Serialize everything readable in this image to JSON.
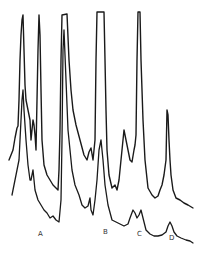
{
  "chart_data": {
    "type": "line",
    "title": "",
    "xlabel": "",
    "ylabel": "",
    "grid": false,
    "legend": null,
    "annotations": [
      {
        "text": "A",
        "x": 40,
        "y": 236
      },
      {
        "text": "B",
        "x": 105,
        "y": 234
      },
      {
        "text": "C",
        "x": 139,
        "y": 236
      },
      {
        "text": "D",
        "x": 171,
        "y": 240
      }
    ],
    "series": [
      {
        "name": "upper-trace",
        "points": [
          [
            9,
            160
          ],
          [
            11,
            155
          ],
          [
            13,
            150
          ],
          [
            15,
            138
          ],
          [
            17,
            128
          ],
          [
            18,
            126
          ],
          [
            19,
            100
          ],
          [
            20,
            60
          ],
          [
            21,
            35
          ],
          [
            22,
            20
          ],
          [
            23,
            15
          ],
          [
            24,
            50
          ],
          [
            25,
            85
          ],
          [
            26,
            100
          ],
          [
            28,
            110
          ],
          [
            30,
            120
          ],
          [
            31,
            140
          ],
          [
            32,
            130
          ],
          [
            33,
            120
          ],
          [
            34,
            125
          ],
          [
            35,
            135
          ],
          [
            36,
            150
          ],
          [
            37,
            100
          ],
          [
            38,
            50
          ],
          [
            39,
            15
          ],
          [
            40,
            35
          ],
          [
            41,
            90
          ],
          [
            42,
            140
          ],
          [
            44,
            165
          ],
          [
            47,
            175
          ],
          [
            50,
            180
          ],
          [
            53,
            185
          ],
          [
            56,
            188
          ],
          [
            58,
            190
          ],
          [
            59,
            170
          ],
          [
            60,
            130
          ],
          [
            61,
            60
          ],
          [
            62,
            15
          ],
          [
            67,
            14
          ],
          [
            69,
            60
          ],
          [
            71,
            90
          ],
          [
            73,
            110
          ],
          [
            76,
            125
          ],
          [
            80,
            140
          ],
          [
            84,
            155
          ],
          [
            87,
            160
          ],
          [
            89,
            152
          ],
          [
            91,
            148
          ],
          [
            93,
            160
          ],
          [
            95,
            140
          ],
          [
            96,
            60
          ],
          [
            97,
            12
          ],
          [
            104,
            12
          ],
          [
            105,
            60
          ],
          [
            106,
            110
          ],
          [
            107,
            150
          ],
          [
            109,
            175
          ],
          [
            112,
            188
          ],
          [
            115,
            185
          ],
          [
            117,
            190
          ],
          [
            119,
            180
          ],
          [
            121,
            160
          ],
          [
            123,
            140
          ],
          [
            124,
            130
          ],
          [
            126,
            140
          ],
          [
            128,
            150
          ],
          [
            130,
            160
          ],
          [
            132,
            162
          ],
          [
            134,
            150
          ],
          [
            135,
            145
          ],
          [
            136,
            135
          ],
          [
            137,
            60
          ],
          [
            138,
            12
          ],
          [
            140,
            12
          ],
          [
            141,
            60
          ],
          [
            143,
            120
          ],
          [
            145,
            160
          ],
          [
            148,
            188
          ],
          [
            152,
            195
          ],
          [
            155,
            198
          ],
          [
            158,
            196
          ],
          [
            160,
            190
          ],
          [
            162,
            185
          ],
          [
            164,
            175
          ],
          [
            166,
            160
          ],
          [
            167,
            110
          ],
          [
            168,
            115
          ],
          [
            169,
            140
          ],
          [
            170,
            160
          ],
          [
            171,
            175
          ],
          [
            173,
            190
          ],
          [
            176,
            198
          ],
          [
            180,
            200
          ],
          [
            184,
            203
          ],
          [
            188,
            205
          ],
          [
            193,
            208
          ]
        ]
      },
      {
        "name": "lower-trace",
        "points": [
          [
            12,
            195
          ],
          [
            13,
            190
          ],
          [
            15,
            180
          ],
          [
            17,
            170
          ],
          [
            18,
            165
          ],
          [
            19,
            160
          ],
          [
            20,
            140
          ],
          [
            21,
            120
          ],
          [
            22,
            100
          ],
          [
            23,
            90
          ],
          [
            24,
            110
          ],
          [
            26,
            140
          ],
          [
            28,
            165
          ],
          [
            30,
            180
          ],
          [
            31,
            180
          ],
          [
            32,
            175
          ],
          [
            33,
            170
          ],
          [
            35,
            190
          ],
          [
            38,
            200
          ],
          [
            41,
            205
          ],
          [
            44,
            210
          ],
          [
            47,
            213
          ],
          [
            50,
            218
          ],
          [
            53,
            216
          ],
          [
            56,
            220
          ],
          [
            59,
            222
          ],
          [
            61,
            200
          ],
          [
            62,
            140
          ],
          [
            63,
            50
          ],
          [
            64,
            30
          ],
          [
            66,
            80
          ],
          [
            68,
            130
          ],
          [
            72,
            170
          ],
          [
            75,
            185
          ],
          [
            79,
            195
          ],
          [
            82,
            205
          ],
          [
            85,
            208
          ],
          [
            88,
            206
          ],
          [
            90,
            198
          ],
          [
            91,
            210
          ],
          [
            93,
            215
          ],
          [
            95,
            200
          ],
          [
            97,
            180
          ],
          [
            99,
            150
          ],
          [
            101,
            140
          ],
          [
            103,
            160
          ],
          [
            105,
            185
          ],
          [
            108,
            205
          ],
          [
            112,
            220
          ],
          [
            116,
            222
          ],
          [
            120,
            224
          ],
          [
            124,
            226
          ],
          [
            128,
            224
          ],
          [
            130,
            218
          ],
          [
            133,
            210
          ],
          [
            135,
            213
          ],
          [
            137,
            218
          ],
          [
            139,
            215
          ],
          [
            141,
            210
          ],
          [
            143,
            218
          ],
          [
            146,
            230
          ],
          [
            150,
            234
          ],
          [
            154,
            236
          ],
          [
            158,
            236
          ],
          [
            162,
            235
          ],
          [
            166,
            232
          ],
          [
            168,
            226
          ],
          [
            170,
            222
          ],
          [
            172,
            226
          ],
          [
            174,
            232
          ],
          [
            177,
            236
          ],
          [
            181,
            238
          ],
          [
            186,
            240
          ],
          [
            190,
            241
          ],
          [
            193,
            243
          ]
        ]
      }
    ]
  },
  "figure": {
    "labels": {
      "a": "A",
      "b": "B",
      "c": "C",
      "d": "D"
    }
  }
}
